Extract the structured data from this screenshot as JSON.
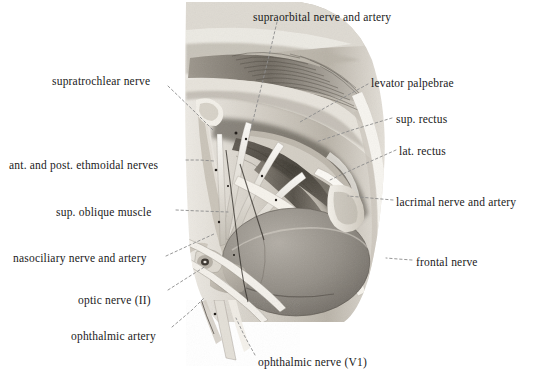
{
  "figure": {
    "kind": "anatomical-illustration",
    "background_color": "#ffffff",
    "text_color": "#1a1a1a",
    "leader_color": "#8c8c8c"
  },
  "labels": [
    {
      "id": "supraorbital",
      "text": "supraorbital nerve and artery",
      "x": 253,
      "y": 12,
      "align": "left"
    },
    {
      "id": "supratrochlear",
      "text": "supratrochlear nerve",
      "x": 52,
      "y": 76,
      "align": "left"
    },
    {
      "id": "levator",
      "text": "levator palpebrae",
      "x": 371,
      "y": 78,
      "align": "left"
    },
    {
      "id": "sup-rectus",
      "text": "sup. rectus",
      "x": 396,
      "y": 114,
      "align": "left"
    },
    {
      "id": "ethmoidal",
      "text": "ant. and post. ethmoidal nerves",
      "x": 9,
      "y": 160,
      "align": "left"
    },
    {
      "id": "lat-rectus",
      "text": "lat. rectus",
      "x": 399,
      "y": 146,
      "align": "left"
    },
    {
      "id": "sup-oblique",
      "text": "sup. oblique muscle",
      "x": 56,
      "y": 207,
      "align": "left"
    },
    {
      "id": "lacrimal",
      "text": "lacrimal nerve and artery",
      "x": 396,
      "y": 197,
      "align": "left"
    },
    {
      "id": "nasociliary",
      "text": "nasociliary nerve and artery",
      "x": 13,
      "y": 253,
      "align": "left"
    },
    {
      "id": "frontal",
      "text": "frontal nerve",
      "x": 416,
      "y": 257,
      "align": "left"
    },
    {
      "id": "optic",
      "text": "optic nerve (II)",
      "x": 78,
      "y": 295,
      "align": "left"
    },
    {
      "id": "ophthalmic-a",
      "text": "ophthalmic artery",
      "x": 71,
      "y": 331,
      "align": "left"
    },
    {
      "id": "ophthalmic-n",
      "text": "ophthalmic nerve (V1)",
      "x": 258,
      "y": 357,
      "align": "left"
    }
  ],
  "leaders": [
    {
      "id": "supraorbital",
      "points": "277,22 268,60 258,100 250,133"
    },
    {
      "id": "supratrochlear",
      "points": "168,86 196,113 214,131"
    },
    {
      "id": "levator",
      "points": "368,84 330,105 300,122"
    },
    {
      "id": "sup-rectus",
      "points": "392,118 352,130 316,142"
    },
    {
      "id": "ethmoidal",
      "points": "186,160 200,160 214,161"
    },
    {
      "id": "lat-rectus",
      "points": "396,150 360,166 330,180"
    },
    {
      "id": "sup-oblique",
      "points": "176,210 200,211 228,212"
    },
    {
      "id": "lacrimal",
      "points": "393,200 370,198 348,196"
    },
    {
      "id": "nasociliary",
      "points": "166,256 192,244 214,234"
    },
    {
      "id": "frontal",
      "points": "412,260 398,259 386,258"
    },
    {
      "id": "optic",
      "points": "168,290 190,276 206,266"
    },
    {
      "id": "ophthalmic-a",
      "points": "172,327 192,310 204,298"
    },
    {
      "id": "ophthalmic-n",
      "points": "255,355 244,335 236,318"
    }
  ]
}
